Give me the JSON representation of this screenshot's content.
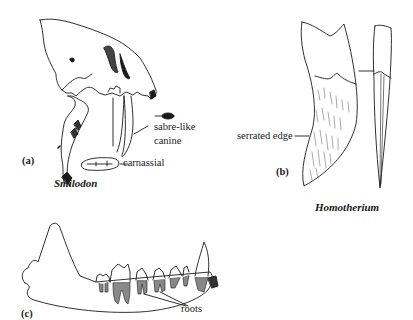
{
  "figure": {
    "panels": [
      {
        "id": "a",
        "marker": "(a)",
        "species": "Smilodon",
        "labels": [
          "sabre-like",
          "canine",
          "carnassial"
        ]
      },
      {
        "id": "b",
        "marker": "(b)",
        "species": "Homotherium",
        "labels": [
          "serrated edge"
        ]
      },
      {
        "id": "c",
        "marker": "(c)",
        "species": "",
        "labels": [
          "roots"
        ]
      }
    ]
  }
}
